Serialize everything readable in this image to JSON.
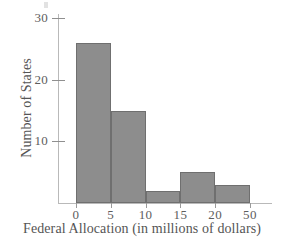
{
  "chart_data": {
    "type": "bar",
    "title": "",
    "subtitle": "",
    "xlabel": "Federal Allocation (in millions of dollars)",
    "ylabel": "Number of States",
    "categories": [
      "0-5",
      "5-10",
      "10-15",
      "15-20",
      "20-50"
    ],
    "bin_edges": [
      0,
      5,
      10,
      15,
      20,
      50
    ],
    "values": [
      26,
      15,
      2,
      5,
      3
    ],
    "x_tick_labels": [
      "0",
      "5",
      "10",
      "15",
      "20",
      "50"
    ],
    "y_tick_labels": [
      "10",
      "20",
      "30"
    ],
    "y_tick_values": [
      10,
      20,
      30
    ],
    "ylim": [
      0,
      30.7
    ],
    "grid": false,
    "legend": null,
    "bar_color": "#8d8d8d",
    "bar_edge_color": "#6f6f6f",
    "axis_color": "#b9b9b9",
    "text_color": "#555555"
  }
}
